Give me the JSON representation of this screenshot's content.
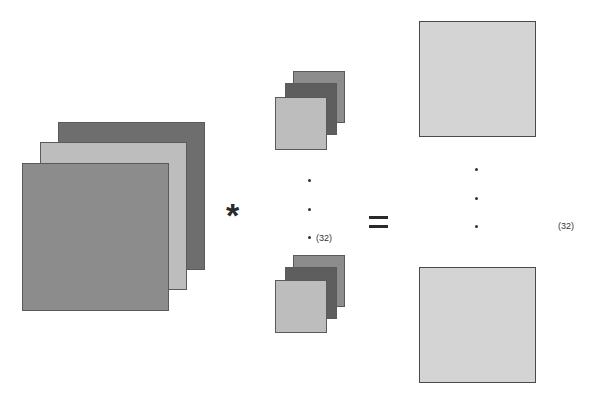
{
  "diagram": {
    "title": "",
    "input_volume": {
      "layers": 3,
      "colors": [
        "#6e6e6e",
        "#bdbdbd",
        "#8c8c8c"
      ]
    },
    "operator_convolve": "*",
    "filters": {
      "count_label": "(32)",
      "shown": 2,
      "layers_each": 3
    },
    "operator_equals": "=",
    "output_maps": {
      "count_label": "(32)",
      "shown": 2,
      "color": "#d4d4d4"
    }
  }
}
